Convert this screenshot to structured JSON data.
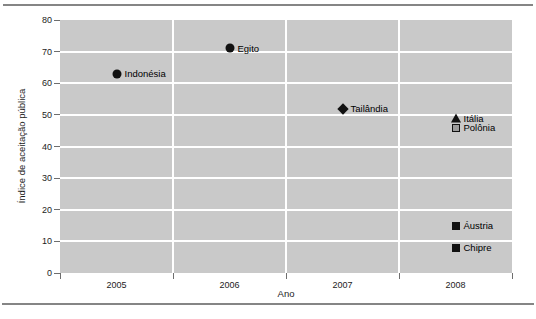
{
  "figure": {
    "background": "#ffffff",
    "rule_color": "#858585"
  },
  "chart_data": {
    "type": "scatter",
    "title": "",
    "xlabel": "Ano",
    "ylabel": "Índice de aceitação pública",
    "x_categories": [
      "2005",
      "2006",
      "2007",
      "2008"
    ],
    "y_ticks": [
      0,
      10,
      20,
      30,
      40,
      50,
      60,
      70,
      80
    ],
    "ylim": [
      0,
      80
    ],
    "grid": true,
    "legend": false,
    "plot_bg": "#c9c9c9",
    "gridline_color": "#ffffff",
    "marker_color": "#111111",
    "points": [
      {
        "label": "Indonésia",
        "x": "2005",
        "y": 63,
        "marker": "circle"
      },
      {
        "label": "Egito",
        "x": "2006",
        "y": 71,
        "marker": "circle"
      },
      {
        "label": "Tailândia",
        "x": "2007",
        "y": 52,
        "marker": "diamond"
      },
      {
        "label": "Itália",
        "x": "2008",
        "y": 49,
        "marker": "triangle"
      },
      {
        "label": "Polônia",
        "x": "2008",
        "y": 46,
        "marker": "square-outline"
      },
      {
        "label": "Áustria",
        "x": "2008",
        "y": 15,
        "marker": "square"
      },
      {
        "label": "Chipre",
        "x": "2008",
        "y": 8,
        "marker": "square"
      }
    ]
  }
}
